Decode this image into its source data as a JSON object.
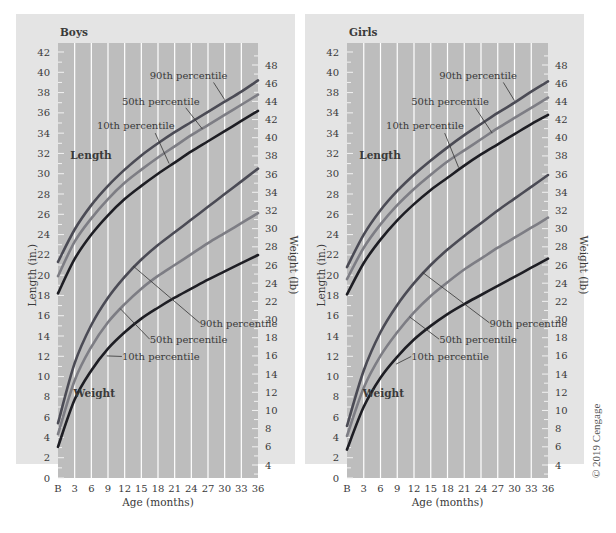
{
  "copyright": "© 2019 Cengage",
  "colors": {
    "panel_bg": "#e4e4e4",
    "plot_bg": "#bdbdbd",
    "grid": "#ffffff",
    "p90": "#4b4b55",
    "p50": "#7d7d84",
    "p10": "#1e1e24",
    "text": "#3a3a3a"
  },
  "chart_data": [
    {
      "type": "line",
      "title": "Boys",
      "xlabel": "Age (months)",
      "ylabel": "Length (in.)",
      "y2label": "Weight (lb)",
      "x": [
        0,
        3,
        6,
        9,
        12,
        15,
        18,
        21,
        24,
        27,
        30,
        33,
        36
      ],
      "x_tick_labels": [
        "B",
        "3",
        "6",
        "9",
        "12",
        "15",
        "18",
        "21",
        "24",
        "27",
        "30",
        "33",
        "36"
      ],
      "y_tick_labels": [
        "0",
        "2",
        "4",
        "6",
        "8",
        "10",
        "12",
        "14",
        "16",
        "18",
        "20",
        "22",
        "24",
        "26",
        "28",
        "30",
        "32",
        "34",
        "36",
        "38",
        "40",
        "42"
      ],
      "y2_tick_labels": [
        "4",
        "6",
        "8",
        "10",
        "12",
        "14",
        "16",
        "18",
        "20",
        "22",
        "24",
        "26",
        "28",
        "30",
        "32",
        "34",
        "36",
        "38",
        "40",
        "42",
        "44",
        "46",
        "48"
      ],
      "ylim": [
        0,
        42
      ],
      "y2lim": [
        4,
        48
      ],
      "grid": "vertical",
      "series": [
        {
          "name": "Length 90th percentile",
          "axis": "left",
          "values": [
            21.3,
            24.5,
            26.9,
            28.8,
            30.4,
            31.8,
            33.0,
            34.1,
            35.1,
            36.1,
            37.1,
            38.1,
            39.2
          ]
        },
        {
          "name": "Length 50th percentile",
          "axis": "left",
          "values": [
            19.9,
            23.3,
            25.6,
            27.5,
            29.1,
            30.4,
            31.6,
            32.7,
            33.8,
            34.8,
            35.8,
            36.8,
            37.8
          ]
        },
        {
          "name": "Length 10th percentile",
          "axis": "left",
          "values": [
            18.2,
            21.6,
            24.0,
            25.9,
            27.5,
            28.8,
            30.0,
            31.1,
            32.2,
            33.2,
            34.2,
            35.2,
            36.2
          ]
        },
        {
          "name": "Weight 90th percentile",
          "axis": "right",
          "values": [
            8.6,
            15.2,
            19.4,
            22.4,
            24.7,
            26.6,
            28.2,
            29.6,
            31.0,
            32.4,
            33.8,
            35.2,
            36.6
          ]
        },
        {
          "name": "Weight 50th percentile",
          "axis": "right",
          "values": [
            7.4,
            13.3,
            17.0,
            19.7,
            21.7,
            23.4,
            24.8,
            26.0,
            27.2,
            28.4,
            29.5,
            30.6,
            31.7
          ]
        },
        {
          "name": "Weight 10th percentile",
          "axis": "right",
          "values": [
            6.0,
            11.2,
            14.4,
            16.8,
            18.6,
            20.1,
            21.3,
            22.4,
            23.4,
            24.4,
            25.3,
            26.2,
            27.1
          ]
        }
      ],
      "annotations": [
        {
          "text": "90th percentile",
          "target": "Length 90th percentile"
        },
        {
          "text": "50th percentile",
          "target": "Length 50th percentile"
        },
        {
          "text": "10th percentile",
          "target": "Length 10th percentile"
        },
        {
          "text": "Length"
        },
        {
          "text": "90th percentile",
          "target": "Weight 90th percentile"
        },
        {
          "text": "50th percentile",
          "target": "Weight 50th percentile"
        },
        {
          "text": "10th percentile",
          "target": "Weight 10th percentile"
        },
        {
          "text": "Weight"
        }
      ]
    },
    {
      "type": "line",
      "title": "Girls",
      "xlabel": "Age (months)",
      "ylabel": "Length (in.)",
      "y2label": "Weight (lb)",
      "x": [
        0,
        3,
        6,
        9,
        12,
        15,
        18,
        21,
        24,
        27,
        30,
        33,
        36
      ],
      "x_tick_labels": [
        "B",
        "3",
        "6",
        "9",
        "12",
        "15",
        "18",
        "21",
        "24",
        "27",
        "30",
        "33",
        "36"
      ],
      "y_tick_labels": [
        "0",
        "2",
        "4",
        "6",
        "8",
        "10",
        "12",
        "14",
        "16",
        "18",
        "20",
        "22",
        "24",
        "26",
        "28",
        "30",
        "32",
        "34",
        "34",
        "38",
        "40",
        "42"
      ],
      "y2_tick_labels": [
        "4",
        "6",
        "8",
        "10",
        "12",
        "14",
        "16",
        "18",
        "20",
        "22",
        "24",
        "26",
        "28",
        "30",
        "32",
        "34",
        "36",
        "38",
        "40",
        "42",
        "44",
        "46",
        "48"
      ],
      "ylim": [
        0,
        42
      ],
      "y2lim": [
        4,
        48
      ],
      "grid": "vertical",
      "series": [
        {
          "name": "Length 90th percentile",
          "axis": "left",
          "values": [
            20.8,
            24.0,
            26.4,
            28.3,
            29.9,
            31.3,
            32.6,
            33.8,
            34.9,
            36.0,
            37.0,
            38.1,
            39.1
          ]
        },
        {
          "name": "Length 50th percentile",
          "axis": "left",
          "values": [
            19.6,
            22.7,
            25.0,
            26.9,
            28.5,
            29.9,
            31.2,
            32.3,
            33.4,
            34.5,
            35.5,
            36.5,
            37.5
          ]
        },
        {
          "name": "Length 10th percentile",
          "axis": "left",
          "values": [
            18.1,
            21.2,
            23.5,
            25.4,
            27.0,
            28.4,
            29.6,
            30.8,
            31.9,
            32.9,
            33.9,
            34.9,
            35.8
          ]
        },
        {
          "name": "Weight 90th percentile",
          "axis": "right",
          "values": [
            8.3,
            14.4,
            18.6,
            21.6,
            24.0,
            26.0,
            27.7,
            29.2,
            30.6,
            32.0,
            33.3,
            34.6,
            35.9
          ]
        },
        {
          "name": "Weight 50th percentile",
          "axis": "right",
          "values": [
            7.2,
            12.5,
            16.0,
            18.6,
            20.8,
            22.6,
            24.1,
            25.5,
            26.7,
            27.9,
            29.0,
            30.1,
            31.2
          ]
        },
        {
          "name": "Weight 10th percentile",
          "axis": "right",
          "values": [
            5.7,
            10.4,
            13.6,
            15.9,
            17.8,
            19.3,
            20.6,
            21.7,
            22.7,
            23.7,
            24.7,
            25.7,
            26.7
          ]
        }
      ],
      "annotations": [
        {
          "text": "90th percentile",
          "target": "Length 90th percentile"
        },
        {
          "text": "50th percentile",
          "target": "Length 50th percentile"
        },
        {
          "text": "10th percentile",
          "target": "Length 10th percentile"
        },
        {
          "text": "Length"
        },
        {
          "text": "90th percentile",
          "target": "Weight 90th percentile"
        },
        {
          "text": "50th percentile",
          "target": "Weight 50th percentile"
        },
        {
          "text": "10th percentile",
          "target": "Weight 10th percentile"
        },
        {
          "text": "Weight"
        }
      ]
    }
  ],
  "layout": [
    {
      "panel": [
        16,
        14,
        279,
        450
      ],
      "plot": [
        58,
        43,
        258,
        478
      ],
      "title_xy": [
        60,
        36
      ]
    },
    {
      "panel": [
        305,
        14,
        279,
        450
      ],
      "plot": [
        347,
        43,
        548,
        478
      ],
      "title_xy": [
        349,
        36
      ]
    }
  ]
}
